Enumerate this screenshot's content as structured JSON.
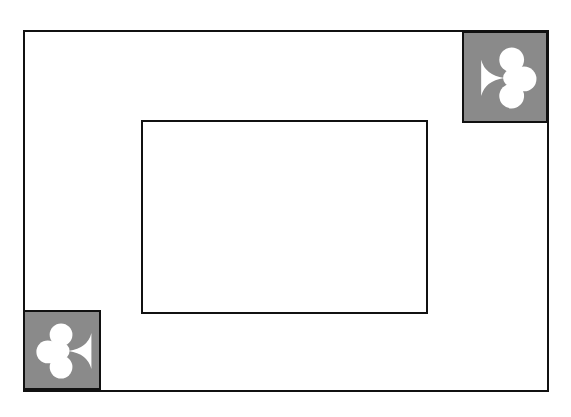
{
  "diagram": {
    "type": "playing-card-layout",
    "corners": [
      {
        "position": "top-right",
        "suit": "club",
        "orientation": "stem-left"
      },
      {
        "position": "bottom-left",
        "suit": "club",
        "orientation": "stem-right"
      }
    ],
    "colors": {
      "border": "#111111",
      "corner_fill": "#8a8a8a",
      "suit_fill": "#ffffff",
      "background": "#ffffff"
    }
  }
}
